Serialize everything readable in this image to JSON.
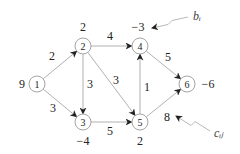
{
  "diagram": {
    "nodes": [
      {
        "id": "1",
        "label": "1",
        "supply": "9",
        "x": 37,
        "y": 84,
        "sx": 22,
        "sy": 88
      },
      {
        "id": "2",
        "label": "2",
        "supply": "2",
        "x": 83,
        "y": 46,
        "sx": 83,
        "sy": 31
      },
      {
        "id": "3",
        "label": "3",
        "supply": "−4",
        "x": 83,
        "y": 122,
        "sx": 83,
        "sy": 145
      },
      {
        "id": "4",
        "label": "4",
        "supply": "−3",
        "x": 140,
        "y": 46,
        "sx": 138,
        "sy": 31
      },
      {
        "id": "5",
        "label": "5",
        "supply": "2",
        "x": 140,
        "y": 122,
        "sx": 140,
        "sy": 145
      },
      {
        "id": "6",
        "label": "6",
        "supply": "−6",
        "x": 187,
        "y": 84,
        "sx": 208,
        "sy": 88
      }
    ],
    "edges": [
      {
        "from": "1",
        "to": "2",
        "cost": "2",
        "lx": 52,
        "ly": 60
      },
      {
        "from": "1",
        "to": "3",
        "cost": "3",
        "lx": 53,
        "ly": 112
      },
      {
        "from": "2",
        "to": "4",
        "cost": "4",
        "lx": 110,
        "ly": 40
      },
      {
        "from": "2",
        "to": "3",
        "cost": "3",
        "lx": 90,
        "ly": 88
      },
      {
        "from": "2",
        "to": "5",
        "cost": "3",
        "lx": 116,
        "ly": 84
      },
      {
        "from": "3",
        "to": "5",
        "cost": "5",
        "lx": 110,
        "ly": 135
      },
      {
        "from": "5",
        "to": "4",
        "cost": "1",
        "lx": 147,
        "ly": 91
      },
      {
        "from": "4",
        "to": "6",
        "cost": "5",
        "lx": 168,
        "ly": 61
      },
      {
        "from": "5",
        "to": "6",
        "cost": "8",
        "lx": 167,
        "ly": 121
      }
    ],
    "annotations": [
      {
        "id": "b_i",
        "text": "bᵢ",
        "x": 193,
        "y": 20,
        "arrow_from": [
          188,
          17
        ],
        "arrow_to": [
          152,
          28
        ]
      },
      {
        "id": "c_ij",
        "text": "cᵢⱼ",
        "x": 214,
        "y": 137,
        "arrow_from": [
          210,
          131
        ],
        "arrow_to": [
          176,
          116
        ]
      }
    ]
  }
}
